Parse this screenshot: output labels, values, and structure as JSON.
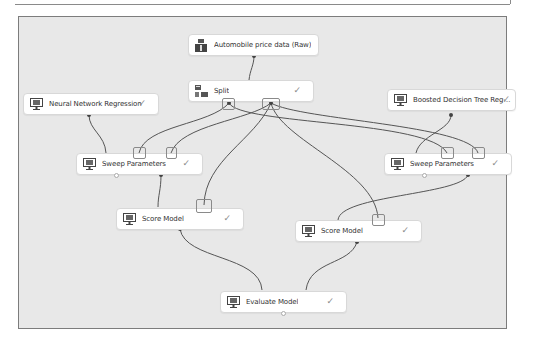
{
  "experiment": {
    "modules": [
      {
        "id": "automobile",
        "label": "Automobile price data (Raw)",
        "icon": "dataset-icon",
        "status": ""
      },
      {
        "id": "split",
        "label": "Split",
        "icon": "split-icon",
        "status": "✓"
      },
      {
        "id": "nn",
        "label": "Neural Network Regression",
        "icon": "monitor-icon",
        "status": "✓"
      },
      {
        "id": "bdt",
        "label": "Boosted Decision Tree Regress...",
        "icon": "monitor-icon",
        "status": "✓"
      },
      {
        "id": "sweep1",
        "label": "Sweep Parameters",
        "icon": "monitor-icon",
        "status": "✓"
      },
      {
        "id": "sweep2",
        "label": "Sweep Parameters",
        "icon": "monitor-icon",
        "status": "✓"
      },
      {
        "id": "score1",
        "label": "Score Model",
        "icon": "monitor-icon",
        "status": "✓"
      },
      {
        "id": "score2",
        "label": "Score Model",
        "icon": "monitor-icon",
        "status": "✓"
      },
      {
        "id": "evaluate",
        "label": "Evaluate Model",
        "icon": "monitor-icon",
        "status": "✓"
      }
    ],
    "colors": {
      "canvas": "#e8e8e8",
      "wire": "#555555",
      "node": "#ffffff",
      "check": "#8a8a8a"
    }
  }
}
